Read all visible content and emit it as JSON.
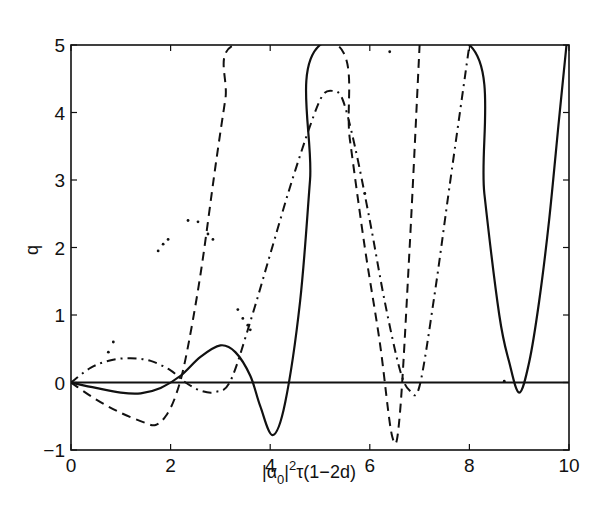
{
  "chart_data": {
    "type": "line",
    "title": "",
    "xlabel": "|α0|²τ(1−2d)",
    "xlabel_parts": {
      "bar_open": "|",
      "alpha": "α",
      "sub": "0",
      "bar_close": "|",
      "sup": "2",
      "rest": "τ(1−2d)"
    },
    "ylabel": "q",
    "xlim": [
      0,
      10
    ],
    "ylim": [
      -1,
      5
    ],
    "xticks": [
      0,
      2,
      4,
      6,
      8,
      10
    ],
    "xtick_labels": [
      "0",
      "2",
      "4",
      "6",
      "8",
      "10"
    ],
    "yticks": [
      -1,
      0,
      1,
      2,
      3,
      4,
      5
    ],
    "ytick_labels": [
      "−1",
      "0",
      "1",
      "2",
      "3",
      "4",
      "5"
    ],
    "grid": false,
    "legend": null,
    "reference_line": {
      "name": "zero-line",
      "y": 0,
      "style": "solid"
    },
    "series": [
      {
        "name": "solid",
        "style": "solid",
        "x": [
          0,
          0.5,
          1.0,
          1.4,
          1.8,
          2.2,
          2.6,
          3.0,
          3.3,
          3.6,
          3.8,
          4.05,
          4.3,
          4.6,
          4.8,
          5.0,
          8.0,
          8.3,
          8.6,
          8.8,
          9.0,
          9.2,
          9.4,
          9.6,
          9.8,
          9.95
        ],
        "y": [
          0,
          -0.08,
          -0.15,
          -0.16,
          -0.08,
          0.1,
          0.38,
          0.55,
          0.45,
          0.1,
          -0.35,
          -0.78,
          -0.3,
          1.2,
          3.0,
          5.0,
          5.0,
          2.8,
          1.0,
          0.3,
          -0.15,
          0.3,
          1.2,
          2.4,
          3.9,
          5.0
        ]
      },
      {
        "name": "dashed",
        "style": "dashed",
        "x": [
          0,
          0.5,
          1.0,
          1.5,
          1.7,
          1.9,
          2.1,
          2.3,
          2.6,
          2.9,
          3.1,
          3.27,
          5.35,
          5.6,
          5.9,
          6.2,
          6.45,
          6.6,
          6.8,
          7.0
        ],
        "y": [
          0,
          -0.25,
          -0.45,
          -0.6,
          -0.63,
          -0.5,
          -0.2,
          0.35,
          1.6,
          3.2,
          4.2,
          5.0,
          5.0,
          3.6,
          2.0,
          0.6,
          -0.8,
          -0.5,
          2.0,
          5.0
        ]
      },
      {
        "name": "dash-dot",
        "style": "dash-dot",
        "x": [
          0,
          0.4,
          0.8,
          1.2,
          1.6,
          2.0,
          2.3,
          2.6,
          2.9,
          3.2,
          3.6,
          4.0,
          4.4,
          4.8,
          5.05,
          5.25,
          5.45,
          5.7,
          6.0,
          6.3,
          6.6,
          6.8,
          7.0,
          7.3,
          7.6,
          8.0
        ],
        "y": [
          0,
          0.22,
          0.33,
          0.36,
          0.32,
          0.18,
          0.0,
          -0.12,
          -0.14,
          0.02,
          0.9,
          1.9,
          2.9,
          3.8,
          4.25,
          4.32,
          4.2,
          3.5,
          2.4,
          1.2,
          0.2,
          -0.12,
          -0.05,
          1.3,
          2.9,
          5.0
        ]
      },
      {
        "name": "dotted",
        "style": "dotted",
        "x": [
          0.75,
          0.85,
          1.75,
          1.85,
          1.95,
          2.35,
          2.55,
          2.75,
          2.85,
          3.35,
          3.45,
          3.55,
          3.6,
          5.9,
          6.4,
          8.7
        ],
        "y": [
          0.45,
          0.6,
          1.95,
          2.05,
          2.12,
          2.4,
          2.38,
          2.2,
          2.12,
          1.08,
          0.95,
          0.85,
          0.78,
          2.8,
          4.9,
          0.02
        ]
      }
    ]
  }
}
